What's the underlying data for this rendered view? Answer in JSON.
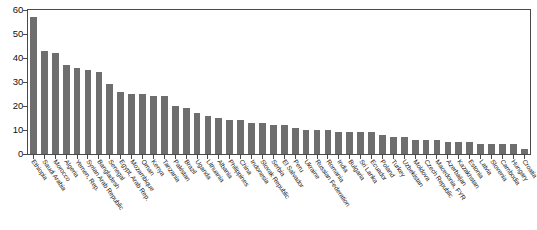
{
  "chart": {
    "type": "bar",
    "bar_color": "#6e6e6e",
    "axis_color": "#4a4a4a",
    "background": "#ffffff"
  },
  "chart_data": {
    "type": "bar",
    "title": "",
    "subtitle": "",
    "xlabel": "",
    "ylabel": "",
    "ylim": [
      0,
      60
    ],
    "yticks": [
      0,
      10,
      20,
      30,
      40,
      50,
      60
    ],
    "grid": false,
    "legend": false,
    "categories": [
      "Ethiopia",
      "Saudi Arabia",
      "Morocco",
      "Algeria",
      "Yemen, Rep.",
      "Syrian Arab Republic",
      "Bangladesh",
      "Senegal",
      "Egypt, Arab Rep.",
      "Mozambique",
      "Oman",
      "Kenya",
      "Tanzania",
      "Pakistan",
      "Brazil",
      "Uganda",
      "Lithuania",
      "Albania",
      "Philippines",
      "China",
      "Indonesia",
      "Slovak Republic",
      "Serbia",
      "El Salvador",
      "Peru",
      "Ukraine",
      "Russian Federation",
      "Romania",
      "India",
      "Bulgaria",
      "Sri Lanka",
      "Ecuador",
      "Poland",
      "Turkey",
      "Uzbekistan",
      "Moldova",
      "Czech Republic",
      "Macedonia, FYR",
      "Azerbaijan",
      "Kazakhstan",
      "Estonia",
      "Latvia",
      "Slovenia",
      "Cambodia",
      "Hungary",
      "Croatia"
    ],
    "values": [
      57,
      43,
      42,
      37,
      36,
      35,
      34,
      29,
      26,
      25,
      25,
      24,
      24,
      20,
      19,
      17,
      16,
      15,
      14,
      14,
      13,
      13,
      12,
      12,
      11,
      10,
      10,
      10,
      9,
      9,
      9,
      9,
      8,
      7,
      7,
      6,
      6,
      6,
      5,
      5,
      5,
      4,
      4,
      4,
      4,
      2
    ]
  }
}
